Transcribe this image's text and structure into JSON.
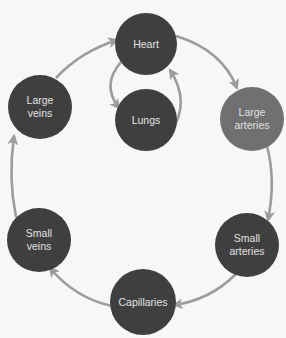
{
  "diagram": {
    "title": "",
    "colors": {
      "background": "#f7f7f7",
      "node": "#3f3f3f",
      "node_highlight": "#707070",
      "arrow": "#9c9c9c",
      "label": "#e2e2e2"
    },
    "nodes": [
      {
        "id": "heart",
        "lines": [
          "Heart"
        ]
      },
      {
        "id": "lungs",
        "lines": [
          "Lungs"
        ]
      },
      {
        "id": "large_arteries",
        "lines": [
          "Large",
          "arteries"
        ]
      },
      {
        "id": "small_arteries",
        "lines": [
          "Small",
          "arteries"
        ]
      },
      {
        "id": "capillaries",
        "lines": [
          "Capillaries"
        ]
      },
      {
        "id": "small_veins",
        "lines": [
          "Small",
          "veins"
        ]
      },
      {
        "id": "large_veins",
        "lines": [
          "Large",
          "veins"
        ]
      }
    ],
    "edges": [
      {
        "from": "heart",
        "to": "large_arteries"
      },
      {
        "from": "large_arteries",
        "to": "small_arteries"
      },
      {
        "from": "small_arteries",
        "to": "capillaries"
      },
      {
        "from": "capillaries",
        "to": "small_veins"
      },
      {
        "from": "small_veins",
        "to": "large_veins"
      },
      {
        "from": "large_veins",
        "to": "heart"
      },
      {
        "from": "heart",
        "to": "lungs"
      },
      {
        "from": "lungs",
        "to": "heart"
      }
    ]
  }
}
